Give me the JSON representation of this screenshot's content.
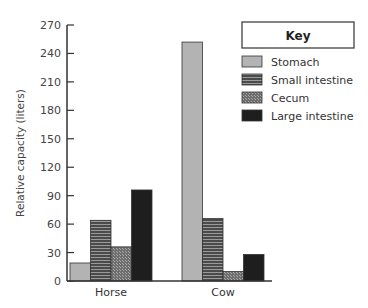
{
  "chart_data": {
    "type": "bar",
    "title": "",
    "xlabel": "",
    "ylabel": "Relative capacity (liters)",
    "ylim": [
      0,
      270
    ],
    "yticks": [
      0,
      30,
      60,
      90,
      120,
      150,
      180,
      210,
      240,
      270
    ],
    "grid": false,
    "legend_position": "upper right",
    "legend_title": "Key",
    "categories": [
      "Horse",
      "Cow"
    ],
    "series": [
      {
        "name": "Stomach",
        "values": [
          19,
          252
        ],
        "fill": "#b3b3b3",
        "pattern": "solid"
      },
      {
        "name": "Small intestine",
        "values": [
          64,
          66
        ],
        "fill": "#555555",
        "pattern": "horizontal-stripes"
      },
      {
        "name": "Cecum",
        "values": [
          36,
          10
        ],
        "fill": "#7a7a7a",
        "pattern": "crosshatch"
      },
      {
        "name": "Large intestine",
        "values": [
          96,
          28
        ],
        "fill": "#1e1e1e",
        "pattern": "solid"
      }
    ]
  }
}
